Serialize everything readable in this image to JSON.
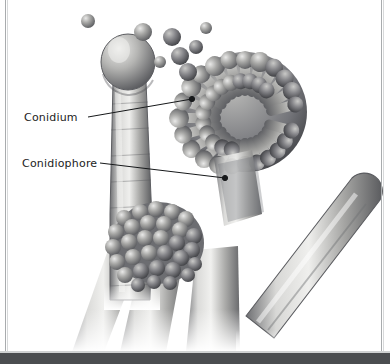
{
  "figure": {
    "kind": "scientific-illustration",
    "palette": {
      "background": "#ffffff",
      "ink": "#1c1c1c",
      "frame_rule": "#a9acae",
      "bottom_bar": "#4b4d50",
      "structure_light": "#e3e3e2",
      "structure_mid": "#9a9a98",
      "structure_dark": "#55565a",
      "structure_shadow": "#3a3b3e"
    }
  },
  "labels": [
    {
      "id": "conidium",
      "text": "Conidium",
      "text_x": 24,
      "text_y": 112,
      "leader": {
        "x1": 88,
        "y1": 117,
        "x2": 192,
        "y2": 99,
        "endpoint": "dot"
      }
    },
    {
      "id": "conidiophore",
      "text": "Conidiophore",
      "text_x": 22,
      "text_y": 158,
      "leader": {
        "x1": 100,
        "y1": 163,
        "x2": 225,
        "y2": 178,
        "endpoint": "dot"
      }
    }
  ],
  "structures": {
    "left_conidiophore": {
      "name": "left-conidiophore-vesicle",
      "vesicle": {
        "cx": 128,
        "cy": 62,
        "rx": 26,
        "ry": 27
      },
      "stalk": {
        "x": 112,
        "y": 80,
        "w": 34,
        "h": 230
      }
    },
    "main_conidial_head": {
      "name": "main-conidial-head",
      "cx": 245,
      "cy": 110,
      "rx": 62,
      "ry": 60,
      "phialide_count": 64
    },
    "lower_conidial_head": {
      "name": "lower-conidial-head",
      "cx": 158,
      "cy": 243,
      "rx": 45,
      "ry": 40,
      "spore_count": 70
    },
    "right_hypha": {
      "name": "right-diagonal-hypha",
      "x1": 250,
      "y1": 300,
      "x2": 368,
      "y2": 186,
      "width": 34
    },
    "free_conidia": [
      {
        "cx": 88,
        "cy": 21,
        "r": 7
      },
      {
        "cx": 143,
        "cy": 32,
        "r": 9
      },
      {
        "cx": 172,
        "cy": 37,
        "r": 9
      },
      {
        "cx": 180,
        "cy": 56,
        "r": 9
      },
      {
        "cx": 188,
        "cy": 72,
        "r": 9
      },
      {
        "cx": 196,
        "cy": 47,
        "r": 7
      },
      {
        "cx": 206,
        "cy": 28,
        "r": 6
      },
      {
        "cx": 160,
        "cy": 62,
        "r": 6
      }
    ]
  }
}
